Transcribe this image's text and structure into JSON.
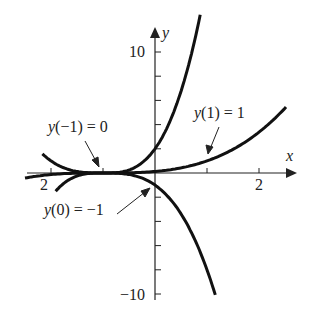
{
  "chart_data": {
    "type": "line",
    "title": "",
    "xlabel": "x",
    "ylabel": "y",
    "xlim": [
      -2.5,
      2.6
    ],
    "ylim": [
      -10.5,
      12
    ],
    "x_tick_labels": [
      "2",
      "2"
    ],
    "y_tick_labels": [
      "10",
      "−10"
    ],
    "series": [
      {
        "name": "y(−1) = 0 family, y(0) = 2",
        "formula": "y = 2(x+1)^3",
        "x": [
          -2.5,
          -2,
          -1.5,
          -1,
          -0.5,
          0,
          0.5,
          0.85
        ],
        "values": [
          -6.75,
          -2,
          -0.25,
          0,
          0.25,
          2,
          6.75,
          12.7
        ]
      },
      {
        "name": "y(1) = 1",
        "formula": "y = (x+1)^3/8",
        "x": [
          -2.5,
          -2,
          -1,
          0,
          1,
          2,
          2.5
        ],
        "values": [
          -0.42,
          -0.13,
          0,
          0.13,
          1,
          3.38,
          5.36
        ]
      },
      {
        "name": "y(0) = −1",
        "formula": "y = −(x+1)^3",
        "x": [
          -2.5,
          -2,
          -1,
          0,
          0.5,
          1,
          1.15
        ],
        "values": [
          3.38,
          1,
          0,
          -1,
          -3.38,
          -8,
          -9.94
        ]
      }
    ],
    "annotations": [
      "y(−1) = 0",
      "y(1) = 1",
      "y(0) = −1"
    ]
  },
  "labels": {
    "x_axis": "x",
    "y_axis": "y",
    "y_top": "10",
    "y_bottom": "−10",
    "x_left": "2",
    "x_right": "2",
    "ann_left_fn": "y",
    "ann_left_rest": "(−1) = 0",
    "ann_right_fn": "y",
    "ann_right_rest": "(1) = 1",
    "ann_bottom_fn": "y",
    "ann_bottom_rest": "(0) = −1"
  }
}
